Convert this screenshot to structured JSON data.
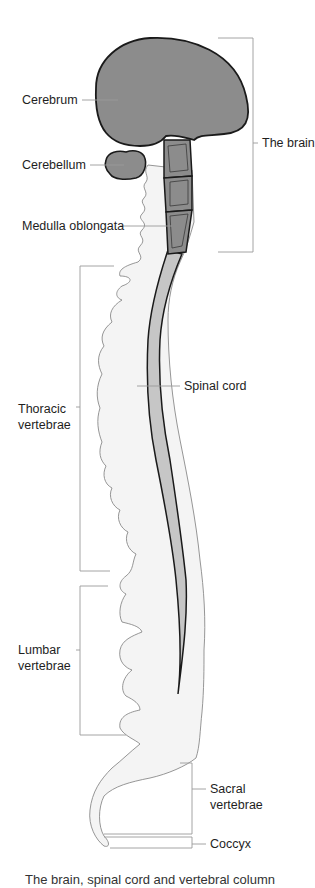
{
  "figure": {
    "colors": {
      "brain_fill": "#8c8c8c",
      "cord_fill": "#c6c6c6",
      "vertebrae_fill": "#f4f4f4",
      "outline": "#1a1a1a",
      "vertebrae_outline": "#8a8a8a",
      "leader_line": "#9a9a9a"
    },
    "labels": {
      "cerebrum": "Cerebrum",
      "cerebellum": "Cerebellum",
      "medulla": "Medulla oblongata",
      "brain": "The brain",
      "spinal_cord": "Spinal cord",
      "thoracic_1": "Thoracic",
      "thoracic_2": "vertebrae",
      "lumbar_1": "Lumbar",
      "lumbar_2": "vertebrae",
      "sacral_1": "Sacral",
      "sacral_2": "vertebrae",
      "coccyx": "Coccyx"
    },
    "caption": "The brain, spinal cord and vertebral column"
  }
}
